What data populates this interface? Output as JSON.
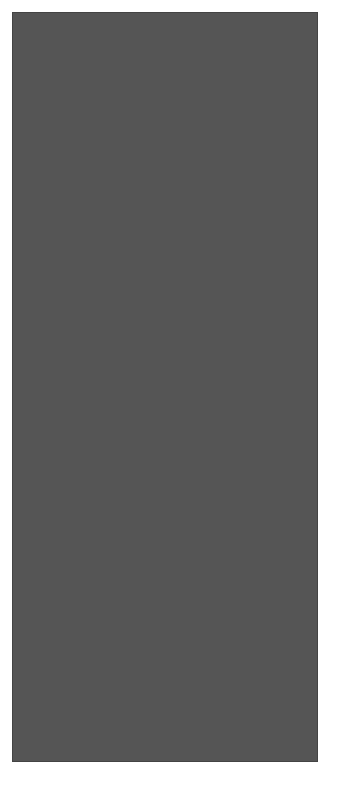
{
  "chart": {
    "columns": 14,
    "rows": 33,
    "legend": {
      "W": {
        "name": "white",
        "color": "#ffffff"
      },
      "D": {
        "name": "dark grey",
        "color": "#5f5f5f"
      },
      "M": {
        "name": "medium grey",
        "color": "#8f8f8f"
      }
    },
    "row_labels": [
      {
        "row": 33,
        "text": "33"
      },
      {
        "row": 30,
        "text": "30"
      },
      {
        "row": 20,
        "text": "20"
      },
      {
        "row": 10,
        "text": "10"
      },
      {
        "row": 1,
        "text": "1"
      }
    ],
    "grid_rows_top_to_bottom": [
      {
        "row": 33,
        "cells": "WWWDWDWDWDWWWW"
      },
      {
        "row": 32,
        "cells": "WWWWDWWWDWWWWW"
      },
      {
        "row": 31,
        "cells": "WWDWDWDWDWDWWW"
      },
      {
        "row": 30,
        "cells": "WWWDDDWDDDWWWW"
      },
      {
        "row": 29,
        "cells": "WWDWDWDWDWDWWW"
      },
      {
        "row": 28,
        "cells": "WWWWWDDDWWWWWW"
      },
      {
        "row": 27,
        "cells": "WWWWDDWDDWWWWW"
      },
      {
        "row": 26,
        "cells": "WWWWDWDWDWWWWW"
      },
      {
        "row": 25,
        "cells": "WWWWDDWDDWWWWW"
      },
      {
        "row": 24,
        "cells": "WWWWWDDDWWWWWW"
      },
      {
        "row": 23,
        "cells": "WWWWWWDWWWWWWW"
      },
      {
        "row": 22,
        "cells": "WWWWWWDWWWWWWW"
      },
      {
        "row": 21,
        "cells": "WWWDDDDDDDWWWW"
      },
      {
        "row": 20,
        "cells": "WWDDDDDDDDDWWW"
      },
      {
        "row": 19,
        "cells": "WDDWDDDDDWDDWW"
      },
      {
        "row": 18,
        "cells": "DDMMDDDDDMMDDM"
      },
      {
        "row": 17,
        "cells": "DMMMDDDDDMMMDD"
      },
      {
        "row": 16,
        "cells": "MMMMMDDDMMMMMD"
      },
      {
        "row": 15,
        "cells": "DMMMMMDMMMMMDM"
      },
      {
        "row": 14,
        "cells": "DMMMMDDDMMMMDM"
      },
      {
        "row": 13,
        "cells": "MMMMDDMDDMMMMD"
      },
      {
        "row": 12,
        "cells": "MMMDDMMMDDMMMM"
      },
      {
        "row": 11,
        "cells": "MMDDMDMDMDDMMM"
      },
      {
        "row": 10,
        "cells": "MDDMDMDMDMDDMM"
      },
      {
        "row": 9,
        "cells": "DDMDMDMDMDMDDM"
      },
      {
        "row": 8,
        "cells": "DMDMDMDMDMDMDD"
      },
      {
        "row": 7,
        "cells": "MDMDMDMDMDMDMD"
      },
      {
        "row": 6,
        "cells": "DDDDDDDDDDDDDD"
      },
      {
        "row": 5,
        "cells": "MDMDMDMDMDMDMD"
      },
      {
        "row": 4,
        "cells": "DDDDDDDDDDDDDD"
      },
      {
        "row": 3,
        "cells": "MMMMDMMMDMMMMM"
      },
      {
        "row": 2,
        "cells": "MMMMDMMMDMMMMM"
      },
      {
        "row": 1,
        "cells": "MMDDMDMDMDDMMM"
      }
    ]
  }
}
